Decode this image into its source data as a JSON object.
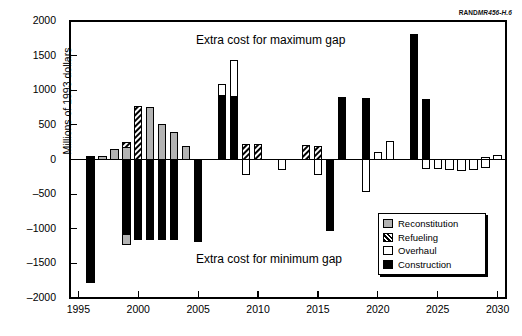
{
  "figure": {
    "credit_prefix": "RAND",
    "credit_suffix": "MR456-H.6",
    "annotation_top": "Extra cost for maximum gap",
    "annotation_bottom": "Extra cost for minimum gap"
  },
  "legend": {
    "position": "bottom-right",
    "items": [
      {
        "label": "Reconstitution",
        "color": "#b3b3b3",
        "swatch": "reconstitution-swatch"
      },
      {
        "label": "Refueling",
        "color": "#000000",
        "swatch": "refueling-swatch"
      },
      {
        "label": "Overhaul",
        "color": "#ffffff",
        "swatch": "overhaul-swatch"
      },
      {
        "label": "Construction",
        "color": "#000000",
        "swatch": "construction-swatch"
      }
    ]
  },
  "chart_data": {
    "type": "bar",
    "title": "",
    "subtitle": "",
    "xlabel": "",
    "ylabel": "Millions of 1993 dollars",
    "xlim": [
      1994.3,
      2030.7
    ],
    "ylim": [
      -2000,
      2000
    ],
    "yticks": [
      2000,
      1500,
      1000,
      500,
      0,
      -500,
      -1000,
      -1500,
      -2000
    ],
    "ytick_labels": [
      "2000",
      "1500",
      "1000",
      "500",
      "0",
      "-500",
      "-1000",
      "-1500",
      "-2000"
    ],
    "xticks": [
      1995,
      2000,
      2005,
      2010,
      2015,
      2020,
      2025,
      2030
    ],
    "xtick_labels": [
      "1995",
      "2000",
      "2005",
      "2010",
      "2015",
      "2020",
      "2025",
      "2030"
    ],
    "grid": false,
    "stacked": true,
    "bar_width_years": 0.62,
    "series": [
      {
        "name": "Reconstitution",
        "color": "#b3b3b3",
        "pattern": "solid-gray"
      },
      {
        "name": "Refueling",
        "color": "#000000",
        "pattern": "diagonal-hatch"
      },
      {
        "name": "Overhaul",
        "color": "#ffffff",
        "pattern": "solid-white"
      },
      {
        "name": "Construction",
        "color": "#000000",
        "pattern": "solid-black"
      }
    ],
    "categories": [
      1995,
      1996,
      1997,
      1998,
      1999,
      2000,
      2001,
      2002,
      2003,
      2004,
      2005,
      2006,
      2007,
      2008,
      2009,
      2010,
      2011,
      2012,
      2013,
      2014,
      2015,
      2016,
      2017,
      2018,
      2019,
      2020,
      2021,
      2022,
      2023,
      2024,
      2025,
      2026,
      2027,
      2028,
      2029,
      2030
    ],
    "bars": [
      {
        "year": 1995,
        "segments": []
      },
      {
        "year": 1996,
        "segments": [
          {
            "series": "Construction",
            "from": 0,
            "to": 40
          },
          {
            "series": "Construction",
            "from": 0,
            "to": -1780
          }
        ]
      },
      {
        "year": 1997,
        "segments": [
          {
            "series": "Reconstitution",
            "from": 0,
            "to": 50
          }
        ]
      },
      {
        "year": 1998,
        "segments": [
          {
            "series": "Reconstitution",
            "from": 0,
            "to": 150
          }
        ]
      },
      {
        "year": 1999,
        "segments": [
          {
            "series": "Reconstitution",
            "from": 0,
            "to": 180
          },
          {
            "series": "Refueling",
            "from": 180,
            "to": 250
          },
          {
            "series": "Construction",
            "from": 0,
            "to": -1080
          },
          {
            "series": "Reconstitution",
            "from": -1080,
            "to": -1230
          }
        ]
      },
      {
        "year": 2000,
        "segments": [
          {
            "series": "Refueling",
            "from": 0,
            "to": 770
          },
          {
            "series": "Construction",
            "from": 0,
            "to": -1150
          }
        ]
      },
      {
        "year": 2001,
        "segments": [
          {
            "series": "Reconstitution",
            "from": 0,
            "to": 745
          },
          {
            "series": "Construction",
            "from": 0,
            "to": -1150
          }
        ]
      },
      {
        "year": 2002,
        "segments": [
          {
            "series": "Reconstitution",
            "from": 0,
            "to": 500
          },
          {
            "series": "Construction",
            "from": 0,
            "to": -1150
          }
        ]
      },
      {
        "year": 2003,
        "segments": [
          {
            "series": "Reconstitution",
            "from": 0,
            "to": 395
          },
          {
            "series": "Construction",
            "from": 0,
            "to": -1150
          }
        ]
      },
      {
        "year": 2004,
        "segments": [
          {
            "series": "Reconstitution",
            "from": 0,
            "to": 190
          }
        ]
      },
      {
        "year": 2005,
        "segments": [
          {
            "series": "Construction",
            "from": 0,
            "to": -1190
          }
        ]
      },
      {
        "year": 2006,
        "segments": []
      },
      {
        "year": 2007,
        "segments": [
          {
            "series": "Construction",
            "from": 0,
            "to": 920
          },
          {
            "series": "Overhaul",
            "from": 920,
            "to": 1085
          }
        ]
      },
      {
        "year": 2008,
        "segments": [
          {
            "series": "Construction",
            "from": 0,
            "to": 915
          },
          {
            "series": "Overhaul",
            "from": 915,
            "to": 1435
          }
        ]
      },
      {
        "year": 2009,
        "segments": [
          {
            "series": "Refueling",
            "from": 0,
            "to": 215
          },
          {
            "series": "Overhaul",
            "from": 0,
            "to": -215
          }
        ]
      },
      {
        "year": 2010,
        "segments": [
          {
            "series": "Refueling",
            "from": 0,
            "to": 215
          }
        ]
      },
      {
        "year": 2011,
        "segments": []
      },
      {
        "year": 2012,
        "segments": [
          {
            "series": "Overhaul",
            "from": 0,
            "to": -150
          }
        ]
      },
      {
        "year": 2013,
        "segments": []
      },
      {
        "year": 2014,
        "segments": [
          {
            "series": "Refueling",
            "from": 0,
            "to": 200
          }
        ]
      },
      {
        "year": 2015,
        "segments": [
          {
            "series": "Refueling",
            "from": 0,
            "to": 195
          },
          {
            "series": "Overhaul",
            "from": 0,
            "to": -215
          }
        ]
      },
      {
        "year": 2016,
        "segments": [
          {
            "series": "Construction",
            "from": 0,
            "to": -1020
          }
        ]
      },
      {
        "year": 2017,
        "segments": [
          {
            "series": "Construction",
            "from": 0,
            "to": 890
          }
        ]
      },
      {
        "year": 2018,
        "segments": []
      },
      {
        "year": 2019,
        "segments": [
          {
            "series": "Construction",
            "from": 0,
            "to": 885
          },
          {
            "series": "Overhaul",
            "from": 0,
            "to": -460
          }
        ]
      },
      {
        "year": 2020,
        "segments": [
          {
            "series": "Overhaul",
            "from": 0,
            "to": 105
          }
        ]
      },
      {
        "year": 2021,
        "segments": [
          {
            "series": "Overhaul",
            "from": 0,
            "to": 255
          }
        ]
      },
      {
        "year": 2022,
        "segments": []
      },
      {
        "year": 2023,
        "segments": [
          {
            "series": "Construction",
            "from": 0,
            "to": 1805
          }
        ]
      },
      {
        "year": 2024,
        "segments": [
          {
            "series": "Construction",
            "from": 0,
            "to": 860
          },
          {
            "series": "Overhaul",
            "from": 0,
            "to": -130
          }
        ]
      },
      {
        "year": 2025,
        "segments": [
          {
            "series": "Overhaul",
            "from": 0,
            "to": -135
          }
        ]
      },
      {
        "year": 2026,
        "segments": [
          {
            "series": "Overhaul",
            "from": 0,
            "to": -150
          }
        ]
      },
      {
        "year": 2027,
        "segments": [
          {
            "series": "Overhaul",
            "from": 0,
            "to": -165
          }
        ]
      },
      {
        "year": 2028,
        "segments": [
          {
            "series": "Overhaul",
            "from": 0,
            "to": -140
          }
        ]
      },
      {
        "year": 2029,
        "segments": [
          {
            "series": "Overhaul",
            "from": 0,
            "to": -120
          },
          {
            "series": "Overhaul",
            "from": 0,
            "to": 35
          }
        ]
      },
      {
        "year": 2030,
        "segments": [
          {
            "series": "Overhaul",
            "from": 0,
            "to": 65
          }
        ]
      }
    ]
  }
}
